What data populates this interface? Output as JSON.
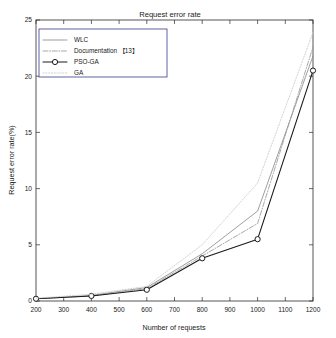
{
  "chart_data": {
    "type": "line",
    "title": "Request error rate",
    "xlabel": "Number of requests",
    "ylabel": "Request error rate(%)",
    "x": [
      200,
      400,
      600,
      800,
      1000,
      1200
    ],
    "xlim": [
      200,
      1200
    ],
    "ylim": [
      0,
      25
    ],
    "xticks": [
      200,
      300,
      400,
      500,
      600,
      700,
      800,
      900,
      1000,
      1100,
      1200
    ],
    "yticks": [
      0,
      5,
      10,
      15,
      20,
      25
    ],
    "grid": false,
    "legend_position": "upper-left",
    "series": [
      {
        "name": "WLC",
        "values": [
          0.2,
          0.5,
          1.2,
          4.2,
          8.0,
          21.8
        ],
        "color": "#8c8c8c",
        "style": "solid",
        "marker": "none"
      },
      {
        "name": "Documentation 【13】",
        "values": [
          0.2,
          0.45,
          1.1,
          4.0,
          6.9,
          22.6
        ],
        "color": "#9a9a9a",
        "style": "dashdot",
        "marker": "none"
      },
      {
        "name": "PSO-GA",
        "values": [
          0.2,
          0.45,
          1.0,
          3.8,
          5.5,
          20.5
        ],
        "color": "#1a1a1a",
        "style": "solid",
        "marker": "circle"
      },
      {
        "name": "GA",
        "values": [
          0.25,
          0.6,
          1.3,
          5.0,
          10.5,
          23.9
        ],
        "color": "#c9c9c9",
        "style": "dotted",
        "marker": "none"
      }
    ]
  },
  "legend": {
    "entries": [
      {
        "label": "WLC"
      },
      {
        "label": "Documentation 【13】"
      },
      {
        "label": "PSO-GA"
      },
      {
        "label": "GA"
      }
    ]
  },
  "axis": {
    "x_tick_labels": [
      "200",
      "300",
      "400",
      "500",
      "600",
      "700",
      "800",
      "900",
      "1000",
      "1100",
      "1200"
    ],
    "y_tick_labels": [
      "0",
      "5",
      "10",
      "15",
      "20",
      "25"
    ]
  }
}
